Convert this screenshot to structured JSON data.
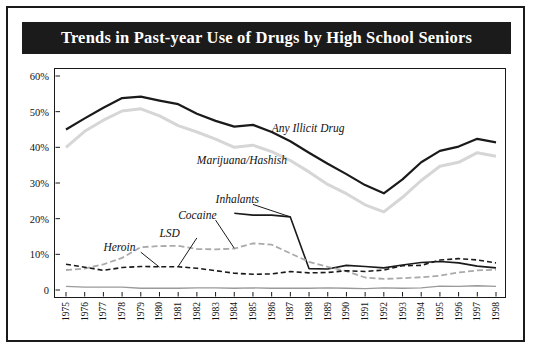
{
  "title": "Trends in Past-year Use of Drugs by High School Seniors",
  "chart_data": {
    "type": "line",
    "title": "Trends in Past-year Use of Drugs by High School Seniors",
    "xlabel": "",
    "ylabel": "",
    "grid": false,
    "legend_position": "inline-annotations",
    "ylim": [
      0,
      60
    ],
    "yticks": [
      "0",
      "10%",
      "20%",
      "30%",
      "40%",
      "50%",
      "60%"
    ],
    "ytick_values": [
      0,
      10,
      20,
      30,
      40,
      50,
      60
    ],
    "categories": [
      "1975",
      "1976",
      "1977",
      "1978",
      "1979",
      "1980",
      "1981",
      "1982",
      "1983",
      "1984",
      "1985",
      "1986",
      "1987",
      "1988",
      "1989",
      "1990",
      "1991",
      "1992",
      "1993",
      "1994",
      "1995",
      "1996",
      "1997",
      "1998"
    ],
    "series": [
      {
        "name": "Any Illicit Drug",
        "label": "Any Illicit Drug",
        "style": "solid-black",
        "color": "#1a1a1a",
        "values": [
          45.0,
          48.1,
          51.1,
          53.8,
          54.2,
          53.1,
          52.1,
          49.4,
          47.4,
          45.8,
          46.3,
          44.3,
          41.7,
          38.5,
          35.4,
          32.5,
          29.4,
          27.1,
          31.0,
          35.8,
          39.0,
          40.2,
          42.4,
          41.4
        ],
        "annotation": {
          "text": "Any Illicit Drug",
          "x_year": 1986,
          "y_value": 45
        }
      },
      {
        "name": "Marijuana/Hashish",
        "label": "Marijuana/Hashish",
        "style": "solid-lightgray",
        "color": "#d6d6d6",
        "values": [
          40.0,
          44.5,
          47.6,
          50.2,
          50.8,
          48.8,
          46.1,
          44.3,
          42.3,
          40.0,
          40.6,
          38.8,
          36.3,
          33.1,
          29.6,
          27.0,
          23.9,
          21.9,
          26.0,
          30.7,
          34.7,
          35.8,
          38.5,
          37.5
        ],
        "annotation": {
          "text": "Marijuana/Hashish",
          "x_year": 1982,
          "y_value": 36
        }
      },
      {
        "name": "Inhalants",
        "label": "Inhalants",
        "style": "solid-black-thin",
        "color": "#1a1a1a",
        "values": [
          null,
          null,
          null,
          null,
          null,
          null,
          null,
          null,
          null,
          21.5,
          21.0,
          21.0,
          20.5,
          6.0,
          5.9,
          6.9,
          6.6,
          6.2,
          7.0,
          7.7,
          8.0,
          7.6,
          6.7,
          6.2
        ],
        "annotation": {
          "text": "Inhalants",
          "x_year": 1983,
          "y_value": 25
        }
      },
      {
        "name": "Cocaine",
        "label": "Cocaine",
        "style": "dashed-gray",
        "color": "#aaaaaa",
        "values": [
          5.6,
          6.0,
          7.2,
          9.0,
          12.0,
          12.3,
          12.4,
          11.5,
          11.4,
          11.6,
          13.1,
          12.7,
          10.3,
          7.9,
          6.5,
          5.3,
          3.5,
          3.1,
          3.3,
          3.6,
          4.0,
          4.9,
          5.5,
          5.7
        ],
        "annotation": {
          "text": "Cocaine",
          "x_year": 1981,
          "y_value": 20.5
        }
      },
      {
        "name": "LSD",
        "label": "LSD",
        "style": "dashed-black",
        "color": "#1a1a1a",
        "values": [
          7.2,
          6.4,
          5.5,
          6.3,
          6.6,
          6.5,
          6.5,
          6.1,
          5.4,
          4.7,
          4.4,
          4.5,
          5.2,
          4.8,
          4.9,
          5.4,
          5.2,
          5.6,
          6.8,
          6.9,
          8.4,
          8.8,
          8.4,
          7.6
        ],
        "annotation": {
          "text": "LSD",
          "x_year": 1980,
          "y_value": 15.5
        }
      },
      {
        "name": "Heroin",
        "label": "Heroin",
        "style": "solid-gray-thin",
        "color": "#9a9a9a",
        "values": [
          1.0,
          0.8,
          0.8,
          0.8,
          0.5,
          0.5,
          0.5,
          0.6,
          0.6,
          0.5,
          0.6,
          0.5,
          0.5,
          0.5,
          0.6,
          0.5,
          0.4,
          0.6,
          0.5,
          0.6,
          1.1,
          1.0,
          1.2,
          1.0
        ],
        "annotation": {
          "text": "Heroin",
          "x_year": 1977,
          "y_value": 11.5
        }
      }
    ],
    "annotation_leaders": [
      {
        "from_label": "Inhalants",
        "to_year": 1987,
        "to_value": 20.5
      },
      {
        "from_label": "Cocaine",
        "to_year": 1984,
        "to_value": 11.7
      },
      {
        "from_label": "LSD",
        "to_year": 1981,
        "to_value": 6.6
      },
      {
        "from_label": "Heroin",
        "to_year": 1980,
        "to_value": 6.4
      }
    ]
  }
}
